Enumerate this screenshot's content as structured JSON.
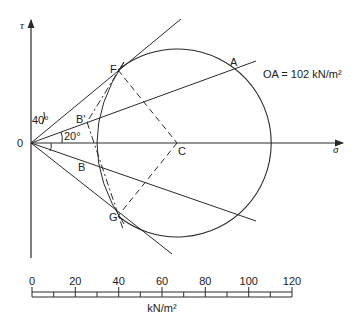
{
  "diagram": {
    "type": "Mohr circle construction",
    "axes": {
      "vertical_label": "τ",
      "horizontal_label": "σ",
      "origin_label": "0"
    },
    "points": {
      "F": "F",
      "A": "A",
      "B_prime": "B'",
      "B": "B",
      "C": "C",
      "G": "G"
    },
    "angles": {
      "upper": "40°",
      "middle": "20°"
    },
    "annotation": "OA = 102 kN/m²",
    "scale_bar": {
      "ticks": [
        "0",
        "20",
        "40",
        "60",
        "80",
        "100",
        "120"
      ],
      "unit": "kN/m²"
    },
    "colors": {
      "ink": "#2a2a2a",
      "background": "#ffffff"
    }
  }
}
